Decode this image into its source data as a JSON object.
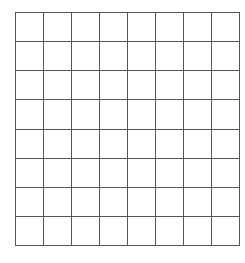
{
  "figure": {
    "type": "grid",
    "name": "empty-grid",
    "rows": 8,
    "columns": 8,
    "cell_count": 64,
    "cells_have_content": false,
    "cell_value": "",
    "colors": {
      "background": "#ffffff",
      "cell_fill": "#ffffff",
      "grid_line": "#555555"
    },
    "geometry": {
      "left": 15,
      "top": 12,
      "width": 216,
      "height": 225,
      "cell_width": 27,
      "cell_height": 28,
      "line_width": 1
    },
    "row_labels": [
      "",
      "",
      "",
      "",
      "",
      "",
      "",
      ""
    ],
    "column_labels": [
      "",
      "",
      "",
      "",
      "",
      "",
      "",
      ""
    ],
    "grid_cells": [
      [
        "",
        "",
        "",
        "",
        "",
        "",
        "",
        ""
      ],
      [
        "",
        "",
        "",
        "",
        "",
        "",
        "",
        ""
      ],
      [
        "",
        "",
        "",
        "",
        "",
        "",
        "",
        ""
      ],
      [
        "",
        "",
        "",
        "",
        "",
        "",
        "",
        ""
      ],
      [
        "",
        "",
        "",
        "",
        "",
        "",
        "",
        ""
      ],
      [
        "",
        "",
        "",
        "",
        "",
        "",
        "",
        ""
      ],
      [
        "",
        "",
        "",
        "",
        "",
        "",
        "",
        ""
      ],
      [
        "",
        "",
        "",
        "",
        "",
        "",
        "",
        ""
      ]
    ]
  }
}
